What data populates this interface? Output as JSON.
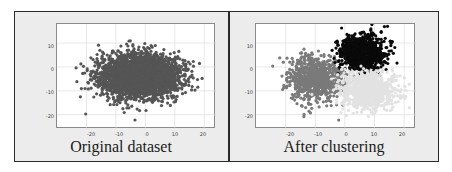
{
  "chart_data": [
    {
      "type": "scatter",
      "title": "Original dataset",
      "xlabel": "",
      "ylabel": "",
      "xlim": [
        -30,
        24
      ],
      "ylim": [
        -26,
        18
      ],
      "x_ticks": [
        "-20",
        "-10",
        "0",
        "10",
        "20"
      ],
      "y_ticks": [
        "10",
        "0",
        "-10",
        "-20"
      ],
      "grid": true,
      "legend": null,
      "series": [
        {
          "name": "all points",
          "color": "#555555",
          "center": [
            -2,
            -4
          ],
          "spread": [
            9,
            6
          ],
          "approx_count": 3000
        }
      ]
    },
    {
      "type": "scatter",
      "title": "After clustering",
      "xlabel": "",
      "ylabel": "",
      "xlim": [
        -30,
        24
      ],
      "ylim": [
        -26,
        18
      ],
      "x_ticks": [
        "-20",
        "-10",
        "0",
        "10",
        "20"
      ],
      "y_ticks": [
        "10",
        "0",
        "-10",
        "-20"
      ],
      "grid": true,
      "legend": null,
      "series": [
        {
          "name": "cluster 1 (gray)",
          "color": "#7a7a7a",
          "center": [
            -10,
            -5
          ],
          "spread": [
            6,
            6
          ]
        },
        {
          "name": "cluster 2 (black)",
          "color": "#0a0a0a",
          "center": [
            6,
            6
          ],
          "spread": [
            5,
            5
          ]
        },
        {
          "name": "cluster 3 (light)",
          "color": "#e2e2e2",
          "center": [
            8,
            -10
          ],
          "spread": [
            6,
            5
          ]
        }
      ]
    }
  ],
  "panels": {
    "left": {
      "caption": "Original dataset"
    },
    "right": {
      "caption": "After clustering"
    }
  },
  "axes": {
    "y_ticks": [
      "10",
      "0",
      "-10",
      "-20"
    ],
    "x_ticks": [
      "-20",
      "-10",
      "0",
      "10",
      "20"
    ]
  }
}
